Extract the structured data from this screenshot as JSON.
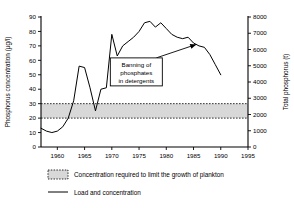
{
  "chart_data": {
    "type": "line",
    "title": "",
    "xlabel": "",
    "ylabel": "Phosphorus concentration  (µg/l)",
    "y2label": "Total phosphorus (t)",
    "xlim": [
      1957,
      1995
    ],
    "ylim": [
      0,
      90
    ],
    "y2lim": [
      0,
      8000
    ],
    "grid": false,
    "xticks": [
      1960,
      1965,
      1970,
      1975,
      1980,
      1985,
      1990,
      1995
    ],
    "xticklabels": [
      "1960",
      "1965",
      "1970",
      "1975",
      "1980",
      "1985",
      "1990",
      "1995"
    ],
    "yticks": [
      0,
      10,
      20,
      30,
      40,
      50,
      60,
      70,
      80,
      90
    ],
    "yticklabels": [
      "0",
      "10",
      "20",
      "30",
      "40",
      "50",
      "60",
      "70",
      "80",
      "90"
    ],
    "y2ticks": [
      0,
      1000,
      2000,
      3000,
      4000,
      5000,
      6000,
      7000,
      8000
    ],
    "y2ticklabels": [
      "0",
      "1000",
      "2000",
      "3000",
      "4000",
      "5000",
      "6000",
      "7000",
      "8000"
    ],
    "band": {
      "label": "Concentration required to limit the growth of plankton",
      "ymin": 20,
      "ymax": 30,
      "fill": "#d8d8d8",
      "edge_style": "dotted"
    },
    "series": [
      {
        "name": "Load and concentration",
        "color": "#000000",
        "x": [
          1957,
          1958,
          1959,
          1960,
          1961,
          1962,
          1963,
          1964,
          1965,
          1966,
          1967,
          1968,
          1969,
          1970,
          1971,
          1972,
          1973,
          1974,
          1975,
          1976,
          1977,
          1978,
          1979,
          1980,
          1981,
          1982,
          1983,
          1984,
          1985,
          1986,
          1987,
          1988,
          1989,
          1990
        ],
        "y": [
          13,
          11,
          10,
          11,
          14,
          20,
          32,
          56,
          55,
          41,
          25,
          40,
          41,
          78,
          63,
          70,
          73,
          76,
          80,
          86,
          87,
          83,
          86,
          82,
          78,
          76,
          75,
          76,
          72,
          70,
          69,
          64,
          57,
          50
        ]
      }
    ],
    "annotations": [
      {
        "text": [
          "Banning of",
          "phosphates",
          "in detergents"
        ],
        "box_x": 1974.5,
        "box_y": 52,
        "arrow_to_x": 1985.5,
        "arrow_to_y": 71
      }
    ],
    "legend": {
      "position": "below-axes",
      "entries": [
        {
          "label": "Concentration required to limit the growth of plankton",
          "marker": "shaded-band-swatch"
        },
        {
          "label": "Load and concentration",
          "marker": "line"
        }
      ]
    }
  },
  "colors": {
    "axis": "#000000",
    "line": "#000000",
    "band_fill": "#d8d8d8",
    "background": "#ffffff"
  }
}
